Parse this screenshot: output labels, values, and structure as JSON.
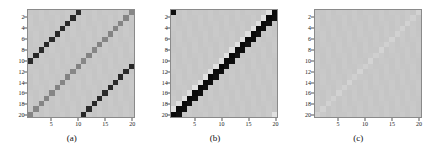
{
  "figure": {
    "width": 430,
    "height": 157,
    "background": "#ffffff",
    "panel_count": 3
  },
  "chart_data": [
    {
      "type": "heatmap",
      "panel_label": "(a)",
      "title": "",
      "xlabel": "",
      "ylabel": "",
      "n_rows": 20,
      "n_cols": 20,
      "xlim": [
        1,
        20
      ],
      "ylim": [
        1,
        20
      ],
      "y_axis_direction": "inverted",
      "grid": false,
      "colormap": "gray",
      "vmin": 0.0,
      "vmax": 1.0,
      "background_value": 0.78,
      "xticks": [
        5,
        10,
        15,
        20
      ],
      "yticks": [
        2,
        4,
        6,
        8,
        10,
        12,
        14,
        16,
        18,
        20
      ],
      "xticklabels": [
        "5",
        "10",
        "15",
        "20"
      ],
      "yticklabels": [
        "2",
        "4",
        "6",
        "8",
        "10",
        "12",
        "14",
        "16",
        "18",
        "20"
      ],
      "description": "Anti-diagonal banded matrix: medium-gray main anti-diagonal plus two dark anti-diagonal bands offset by +/-10 columns (wrapped).",
      "bands": [
        {
          "offset": 0,
          "value": 0.52,
          "note": "main anti-diagonal, medium gray"
        },
        {
          "offset": 10,
          "value": 0.16,
          "note": "dark band, upper-right"
        },
        {
          "offset": -10,
          "value": 0.16,
          "note": "dark band, lower-left"
        }
      ]
    },
    {
      "type": "heatmap",
      "panel_label": "(b)",
      "title": "",
      "xlabel": "",
      "ylabel": "",
      "n_rows": 20,
      "n_cols": 20,
      "xlim": [
        1,
        20
      ],
      "ylim": [
        1,
        20
      ],
      "y_axis_direction": "inverted",
      "grid": false,
      "colormap": "gray",
      "vmin": 0.0,
      "vmax": 1.0,
      "background_value": 0.78,
      "xticks": [
        5,
        10,
        15,
        20
      ],
      "yticks": [
        2,
        4,
        6,
        8,
        10,
        12,
        14,
        16,
        18,
        20
      ],
      "xticklabels": [
        "5",
        "10",
        "15",
        "20"
      ],
      "yticklabels": [
        "2",
        "4",
        "6",
        "8",
        "10",
        "12",
        "14",
        "16",
        "18",
        "20"
      ],
      "description": "Thick black anti-diagonal band about two cells wide with a lighter halo stripe immediately below-left; small dark block at bottom-left corner.",
      "bands": [
        {
          "offset": 0,
          "value": 0.04,
          "note": "black anti-diagonal core"
        },
        {
          "offset": 1,
          "value": 0.06,
          "note": "black anti-diagonal second cell"
        },
        {
          "offset": -1,
          "value": 0.88,
          "note": "light halo stripe"
        }
      ]
    },
    {
      "type": "heatmap",
      "panel_label": "(c)",
      "title": "",
      "xlabel": "",
      "ylabel": "",
      "n_rows": 20,
      "n_cols": 20,
      "xlim": [
        1,
        20
      ],
      "ylim": [
        1,
        20
      ],
      "y_axis_direction": "inverted",
      "grid": false,
      "colormap": "gray",
      "vmin": 0.0,
      "vmax": 1.0,
      "background_value": 0.78,
      "xticks": [
        5,
        10,
        15,
        20
      ],
      "yticks": [
        2,
        4,
        6,
        8,
        10,
        12,
        14,
        16,
        18,
        20
      ],
      "xticklabels": [
        "5",
        "10",
        "15",
        "20"
      ],
      "yticklabels": [
        "2",
        "4",
        "6",
        "8",
        "10",
        "12",
        "14",
        "16",
        "18",
        "20"
      ],
      "description": "Nearly uniform gray matrix with a very faint lighter mottled anti-diagonal; almost no structure visible.",
      "bands": [
        {
          "offset": 0,
          "value": 0.82,
          "note": "faint light anti-diagonal"
        }
      ]
    }
  ],
  "panels": [
    {
      "caption": "(a)"
    },
    {
      "caption": "(b)"
    },
    {
      "caption": "(c)"
    }
  ]
}
